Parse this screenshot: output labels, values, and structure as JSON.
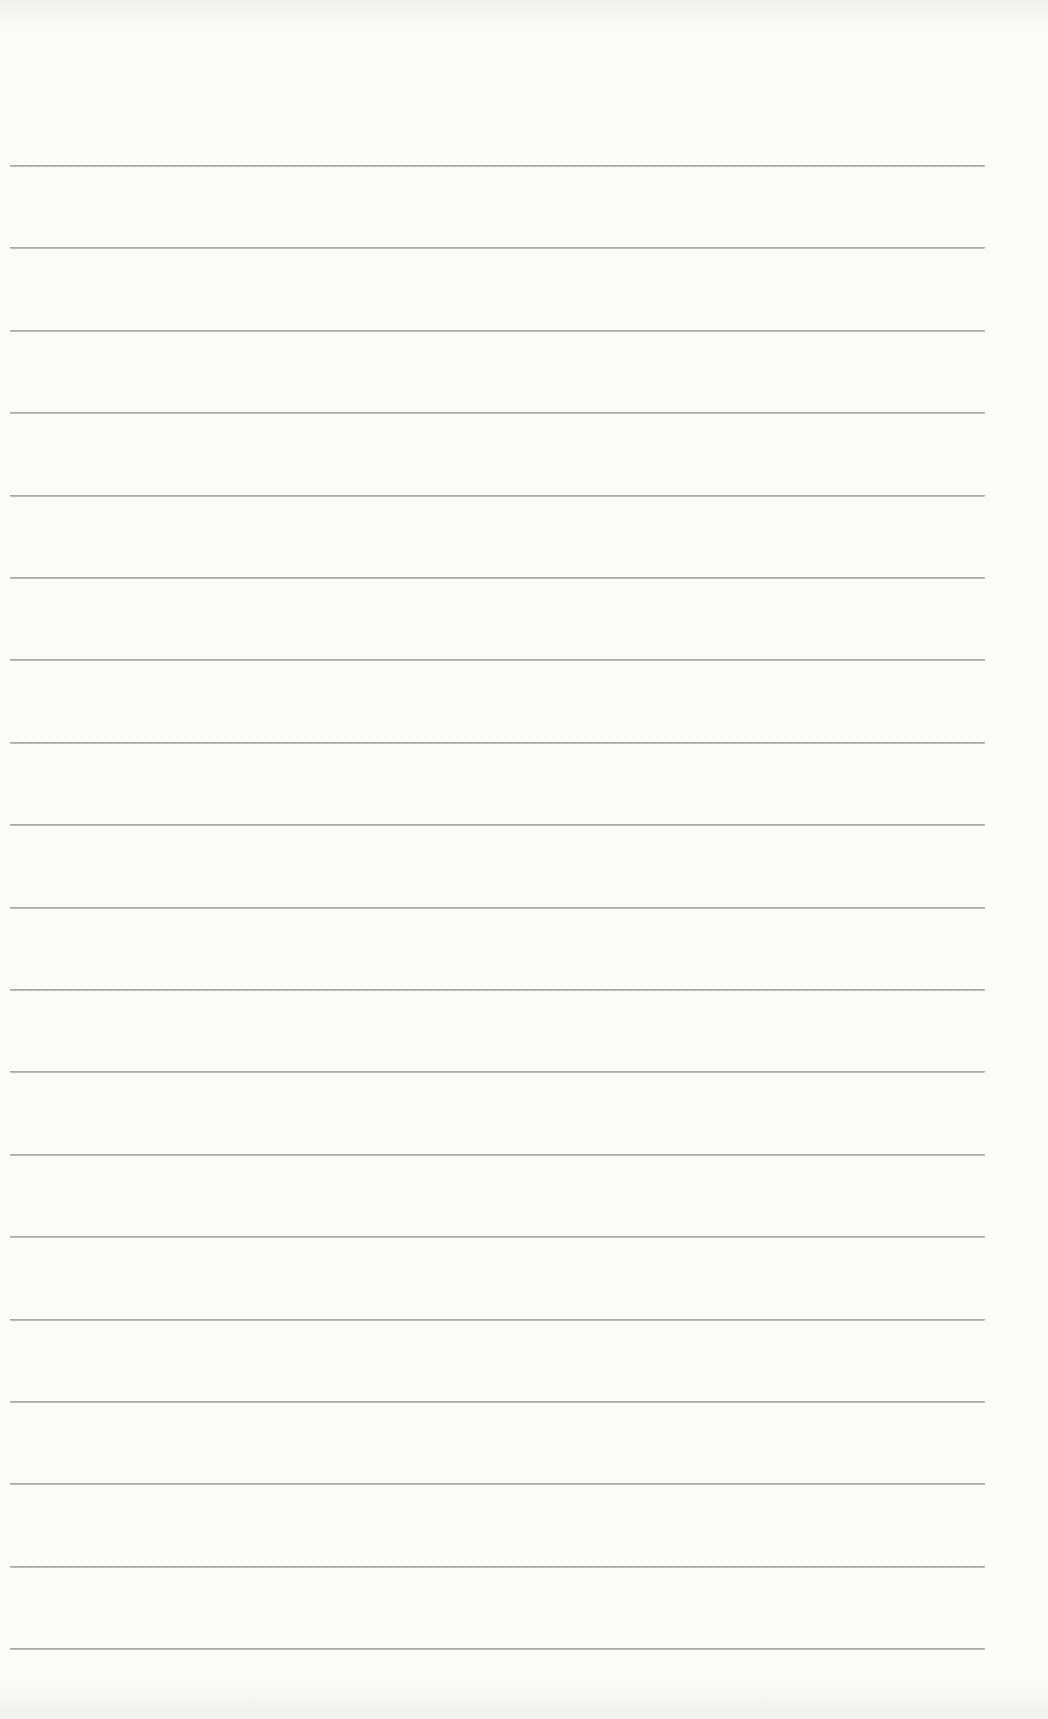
{
  "page": {
    "type": "lined-paper",
    "background": "#fbfbfa",
    "line_color": "#a9a9a9",
    "line_count": 19,
    "first_line_y": 165,
    "line_spacing": 82.4,
    "line_left": 10,
    "line_width": 975,
    "text": ""
  }
}
